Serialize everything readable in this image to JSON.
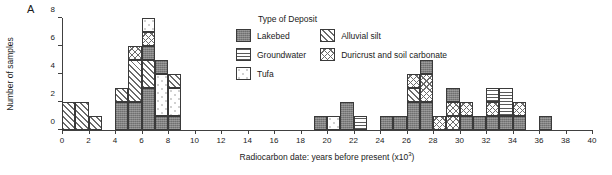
{
  "panel_label": "A",
  "legend": {
    "title": "Type of Deposit",
    "column1": [
      {
        "label": "Lakebed",
        "pattern": "lakebed"
      },
      {
        "label": "Groundwater",
        "pattern": "groundwater"
      },
      {
        "label": "Tufa",
        "pattern": "tufa"
      }
    ],
    "column2": [
      {
        "label": "Alluvial silt",
        "pattern": "alluvial"
      },
      {
        "label": "Duricrust and soil carbonate",
        "pattern": "duricrust"
      }
    ]
  },
  "chart_data": {
    "type": "bar",
    "subtype": "stacked-histogram",
    "title": "",
    "xlabel": "Radiocarbon date: years before present (x10³)",
    "ylabel": "Number of samples",
    "xlim": [
      0,
      40
    ],
    "ylim": [
      0,
      8
    ],
    "xticks": [
      0,
      2,
      4,
      6,
      8,
      10,
      12,
      14,
      16,
      18,
      20,
      22,
      24,
      26,
      28,
      30,
      32,
      34,
      36,
      38,
      40
    ],
    "yticks": [
      0,
      2,
      4,
      6,
      8
    ],
    "bin_width": 1,
    "grid": false,
    "legend_position": "top-center",
    "categories": [
      "Lakebed",
      "Groundwater",
      "Tufa",
      "Alluvial silt",
      "Duricrust and soil carbonate"
    ],
    "bins": [
      {
        "x0": 0,
        "total": 2,
        "segments": [
          {
            "type": "alluvial",
            "count": 2
          }
        ]
      },
      {
        "x0": 1,
        "total": 2,
        "segments": [
          {
            "type": "alluvial",
            "count": 2
          }
        ]
      },
      {
        "x0": 2,
        "total": 1,
        "segments": [
          {
            "type": "alluvial",
            "count": 1
          }
        ]
      },
      {
        "x0": 4,
        "total": 3,
        "segments": [
          {
            "type": "lakebed",
            "count": 2
          },
          {
            "type": "alluvial",
            "count": 1
          }
        ]
      },
      {
        "x0": 5,
        "total": 6,
        "segments": [
          {
            "type": "lakebed",
            "count": 2
          },
          {
            "type": "alluvial",
            "count": 3
          },
          {
            "type": "duricrust",
            "count": 1
          }
        ]
      },
      {
        "x0": 6,
        "total": 8,
        "segments": [
          {
            "type": "lakebed",
            "count": 3
          },
          {
            "type": "alluvial",
            "count": 2
          },
          {
            "type": "lakebed",
            "count": 1
          },
          {
            "type": "duricrust",
            "count": 1
          },
          {
            "type": "tufa",
            "count": 1
          }
        ]
      },
      {
        "x0": 7,
        "total": 5,
        "segments": [
          {
            "type": "lakebed",
            "count": 1
          },
          {
            "type": "tufa",
            "count": 3
          },
          {
            "type": "lakebed",
            "count": 1
          }
        ]
      },
      {
        "x0": 8,
        "total": 4,
        "segments": [
          {
            "type": "lakebed",
            "count": 1
          },
          {
            "type": "tufa",
            "count": 2
          },
          {
            "type": "alluvial",
            "count": 1
          }
        ]
      },
      {
        "x0": 19,
        "total": 1,
        "segments": [
          {
            "type": "lakebed",
            "count": 1
          }
        ]
      },
      {
        "x0": 20,
        "total": 1,
        "segments": [
          {
            "type": "tufa",
            "count": 1
          }
        ]
      },
      {
        "x0": 21,
        "total": 2,
        "segments": [
          {
            "type": "lakebed",
            "count": 2
          }
        ]
      },
      {
        "x0": 22,
        "total": 1,
        "segments": [
          {
            "type": "groundwater",
            "count": 1
          }
        ]
      },
      {
        "x0": 24,
        "total": 1,
        "segments": [
          {
            "type": "lakebed",
            "count": 1
          }
        ]
      },
      {
        "x0": 25,
        "total": 1,
        "segments": [
          {
            "type": "lakebed",
            "count": 1
          }
        ]
      },
      {
        "x0": 26,
        "total": 4,
        "segments": [
          {
            "type": "lakebed",
            "count": 2
          },
          {
            "type": "alluvial",
            "count": 1
          },
          {
            "type": "duricrust",
            "count": 1
          }
        ]
      },
      {
        "x0": 27,
        "total": 5,
        "segments": [
          {
            "type": "lakebed",
            "count": 2
          },
          {
            "type": "duricrust",
            "count": 2
          },
          {
            "type": "lakebed",
            "count": 1
          }
        ]
      },
      {
        "x0": 28,
        "total": 1,
        "segments": [
          {
            "type": "duricrust",
            "count": 1
          }
        ]
      },
      {
        "x0": 29,
        "total": 3,
        "segments": [
          {
            "type": "duricrust",
            "count": 1
          },
          {
            "type": "duricrust",
            "count": 1
          },
          {
            "type": "lakebed",
            "count": 1
          }
        ]
      },
      {
        "x0": 30,
        "total": 2,
        "segments": [
          {
            "type": "lakebed",
            "count": 1
          },
          {
            "type": "duricrust",
            "count": 1
          }
        ]
      },
      {
        "x0": 31,
        "total": 1,
        "segments": [
          {
            "type": "lakebed",
            "count": 1
          }
        ]
      },
      {
        "x0": 32,
        "total": 3,
        "segments": [
          {
            "type": "lakebed",
            "count": 1
          },
          {
            "type": "duricrust",
            "count": 1
          },
          {
            "type": "groundwater",
            "count": 1
          }
        ]
      },
      {
        "x0": 33,
        "total": 3,
        "segments": [
          {
            "type": "lakebed",
            "count": 1
          },
          {
            "type": "groundwater",
            "count": 2
          }
        ]
      },
      {
        "x0": 34,
        "total": 2,
        "segments": [
          {
            "type": "lakebed",
            "count": 1
          },
          {
            "type": "duricrust",
            "count": 1
          }
        ]
      },
      {
        "x0": 36,
        "total": 1,
        "segments": [
          {
            "type": "lakebed",
            "count": 1
          }
        ]
      }
    ]
  }
}
